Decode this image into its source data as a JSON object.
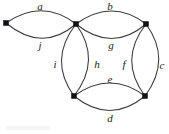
{
  "figure": {
    "width": 169,
    "height": 134,
    "background_color": "#ffffff",
    "edge_color": "#3a3a40",
    "vertex_color": "#121216",
    "label_color": "#1d1d22"
  },
  "vertices": [
    {
      "id": "v-left",
      "name": "left-vertex",
      "x": 6,
      "y": 23
    },
    {
      "id": "v-top-middle",
      "name": "top-middle-vertex",
      "x": 76,
      "y": 24
    },
    {
      "id": "v-top-right",
      "name": "top-right-vertex",
      "x": 146,
      "y": 24
    },
    {
      "id": "v-bottom-left",
      "name": "bottom-left-vertex",
      "x": 74,
      "y": 96
    },
    {
      "id": "v-bottom-right",
      "name": "bottom-right-vertex",
      "x": 145,
      "y": 96
    }
  ],
  "edges": [
    {
      "id": "edge-a",
      "label": "a",
      "from": "v-left",
      "to": "v-top-middle",
      "bulge": "up",
      "label_x": 40,
      "label_y": 6
    },
    {
      "id": "edge-j",
      "label": "j",
      "from": "v-left",
      "to": "v-top-middle",
      "bulge": "down",
      "label_x": 40,
      "label_y": 45
    },
    {
      "id": "edge-b",
      "label": "b",
      "from": "v-top-middle",
      "to": "v-top-right",
      "bulge": "up",
      "label_x": 110,
      "label_y": 6
    },
    {
      "id": "edge-g",
      "label": "g",
      "from": "v-top-middle",
      "to": "v-top-right",
      "bulge": "down",
      "label_x": 111,
      "label_y": 45
    },
    {
      "id": "edge-i",
      "label": "i",
      "from": "v-top-middle",
      "to": "v-bottom-left",
      "bulge": "left",
      "label_x": 55,
      "label_y": 64
    },
    {
      "id": "edge-h",
      "label": "h",
      "from": "v-top-middle",
      "to": "v-bottom-left",
      "bulge": "right",
      "label_x": 97,
      "label_y": 64
    },
    {
      "id": "edge-f",
      "label": "f",
      "from": "v-top-right",
      "to": "v-bottom-right",
      "bulge": "left",
      "label_x": 124,
      "label_y": 64
    },
    {
      "id": "edge-c",
      "label": "c",
      "from": "v-top-right",
      "to": "v-bottom-right",
      "bulge": "right",
      "label_x": 162,
      "label_y": 65
    },
    {
      "id": "edge-e",
      "label": "e",
      "from": "v-bottom-left",
      "to": "v-bottom-right",
      "bulge": "up",
      "label_x": 110,
      "label_y": 79
    },
    {
      "id": "edge-d",
      "label": "d",
      "from": "v-bottom-left",
      "to": "v-bottom-right",
      "bulge": "down",
      "label_x": 110,
      "label_y": 118
    }
  ],
  "edge_paths": {
    "edge-a": "M 6 23 Q 42 -2 76 24",
    "edge-j": "M 6 23 Q 42 53 76 24",
    "edge-b": "M 76 24 Q 112 -2 146 24",
    "edge-g": "M 76 24 Q 112 53 146 24",
    "edge-i": "M 76 24 Q 48 60 74 96",
    "edge-h": "M 76 24 Q 102 60 74 96",
    "edge-f": "M 146 24 Q 118 60 145 96",
    "edge-c": "M 146 24 Q 172 60 145 96",
    "edge-e": "M 74 96 Q 110 70 145 96",
    "edge-d": "M 74 96 Q 110 125 145 96"
  }
}
